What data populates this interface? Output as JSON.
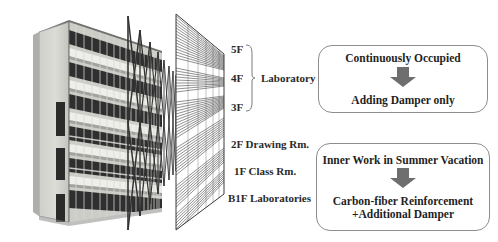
{
  "figure": {
    "left_image": {
      "name": "building-photograph",
      "description": "Perspective photograph of a multi-story laboratory building"
    },
    "diagrams": [
      {
        "name": "brace-frame-diagram",
        "description": "X-braced structural frame elevation in perspective"
      },
      {
        "name": "line-frame-diagram",
        "description": "Dense line structural frame elevation in perspective"
      }
    ]
  },
  "floors": {
    "upper_group": {
      "levels": [
        "5F",
        "4F",
        "3F"
      ],
      "use_label": "Laboratory Offices"
    },
    "lower_list": [
      {
        "level": "2F",
        "use": "Drawing Rm.",
        "text": "2F Drawing Rm."
      },
      {
        "level": "1F",
        "use": "Class Rm.",
        "text": "1F Class Rm."
      },
      {
        "level": "B1F",
        "use": "Laboratories",
        "text": "B1F Laboratories"
      }
    ]
  },
  "callouts": {
    "upper": {
      "condition": "Continuously Occupied",
      "arrow": "down-arrow-icon",
      "measure_line_1": "Adding Damper only",
      "measure_line_2": ""
    },
    "lower": {
      "condition": "Inner Work in Summer Vacation",
      "arrow": "down-arrow-icon",
      "measure_line_1": "Carbon-fiber Reinforcement",
      "measure_line_2": "+Additional Damper"
    }
  },
  "colors": {
    "box_border": "#8d8d8d",
    "arrow_fill": "#6e6e6e",
    "text": "#1f1f1f",
    "photo_wall_light": "#d9d9d5",
    "photo_wall_mid": "#b9b9b5",
    "photo_dark": "#3a3a3a"
  }
}
